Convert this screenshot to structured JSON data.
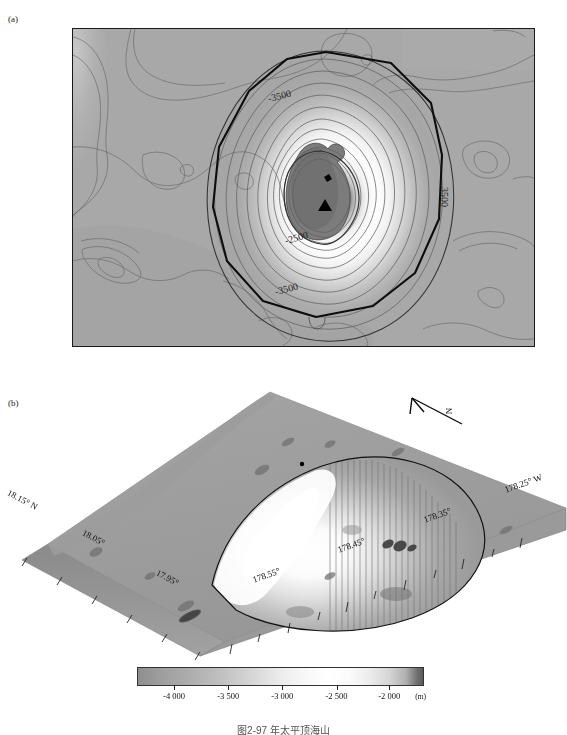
{
  "figure": {
    "caption": "图2-97  年太平顶海山",
    "panels": [
      {
        "id": "a",
        "label": "(a)",
        "type": "contour-map"
      },
      {
        "id": "b",
        "label": "(b)",
        "type": "3d-perspective-surface"
      }
    ]
  },
  "panel_a": {
    "label": "(a)",
    "north_letter": "N",
    "x_axis": {
      "labels": [
        "178.55°",
        "178.45°",
        "178.35°",
        "178.25°"
      ],
      "hemisphere_suffix": "W",
      "positions_pct": [
        23.2,
        47.3,
        71.5,
        95.2
      ],
      "minor_tick_count": 20
    },
    "y_axis": {
      "labels": [
        "18.15°",
        "18.05°",
        "17.95°"
      ],
      "hemisphere_suffix": "N",
      "positions_pct": [
        2.2,
        40.8,
        79.5
      ],
      "minor_tick_count": 13
    },
    "contour_labels": [
      {
        "text": "-3500",
        "x_pct": 44,
        "y_pct": 17,
        "rotation": -12
      },
      {
        "text": "3500",
        "x_pct": 84,
        "y_pct": 50,
        "rotation": 90
      },
      {
        "text": "-2500",
        "x_pct": 48,
        "y_pct": 66,
        "rotation": -14
      },
      {
        "text": "-3500",
        "x_pct": 46,
        "y_pct": 83,
        "rotation": -13
      }
    ],
    "markers": [
      {
        "name": "summit-triangle",
        "shape": "triangle",
        "x_pct": 54.6,
        "y_pct": 55.8
      },
      {
        "name": "sample-dot",
        "shape": "dot",
        "x_pct": 54.7,
        "y_pct": 47.5
      }
    ],
    "background_color": "#a8a8a8",
    "frame_color": "#1a1a1a"
  },
  "panel_b": {
    "label": "(b)",
    "north_arrow_letter": "N",
    "axis_labels_left": [
      "18.15° N",
      "18.05°",
      "17.95°"
    ],
    "axis_labels_right": [
      "178.55°",
      "178.45°",
      "178.35°",
      "178.25° W"
    ],
    "surface_base_color": "#9d9d9d"
  },
  "colorbar": {
    "ticks": [
      "-4 000",
      "-3 500",
      "-3 000",
      "-2 500",
      "-2 000"
    ],
    "unit": "(m)",
    "tick_positions_pct": [
      13.0,
      32.0,
      51.0,
      70.0,
      88.5
    ],
    "min_value": -4350,
    "max_value": -1800
  },
  "chart_data": {
    "type": "heatmap",
    "xlabel": "Longitude (W)",
    "ylabel": "Latitude (N)",
    "xlim": [
      -178.6,
      -178.22
    ],
    "ylim": [
      17.92,
      18.16
    ],
    "zlabel": "Depth (m)",
    "zlim": [
      -4350,
      -1800
    ],
    "colorbar_ticks": [
      -4000,
      -3500,
      -3000,
      -2500,
      -2000
    ],
    "contour_interval_m": 100,
    "labeled_contours_m": [
      -3500,
      -2500
    ],
    "summit_depth_m": -1900,
    "grid": false,
    "legend": "none"
  }
}
